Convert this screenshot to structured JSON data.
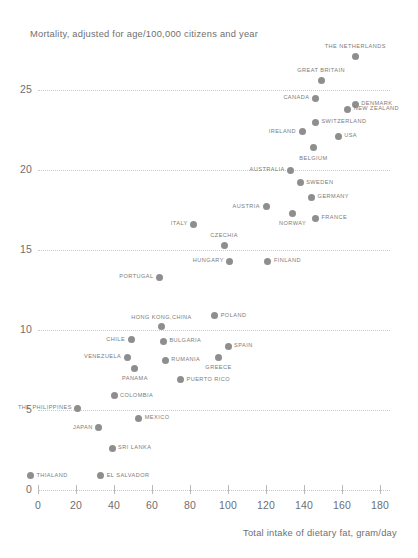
{
  "chart_data": {
    "type": "scatter",
    "title": "",
    "ylabel": "Mortality, adjusted for age/100,000 citizens and year",
    "xlabel": "Total intake of dietary fat, gram/day",
    "xlim": [
      0,
      185
    ],
    "ylim": [
      0,
      27.5
    ],
    "grid": true,
    "legend": false,
    "x_ticks": [
      0,
      20,
      40,
      60,
      80,
      100,
      120,
      140,
      160,
      180
    ],
    "y_ticks": [
      0,
      5,
      10,
      15,
      20,
      25
    ],
    "marker_color": "#8e8e8e",
    "points": [
      {
        "label": "THE NETHERLANDS",
        "x": 167,
        "y": 27.1,
        "pos": "above"
      },
      {
        "label": "GREAT BRITAIN",
        "x": 149,
        "y": 25.6,
        "pos": "above"
      },
      {
        "label": "DENMARK",
        "x": 167,
        "y": 24.1,
        "pos": "right"
      },
      {
        "label": "CANADA",
        "x": 146,
        "y": 24.5,
        "pos": "left"
      },
      {
        "label": "NEW ZEALAND",
        "x": 163,
        "y": 23.8,
        "pos": "right"
      },
      {
        "label": "SWITZERLAND",
        "x": 146,
        "y": 23.0,
        "pos": "right"
      },
      {
        "label": "IRELAND",
        "x": 139,
        "y": 22.4,
        "pos": "left"
      },
      {
        "label": "USA",
        "x": 158,
        "y": 22.1,
        "pos": "right"
      },
      {
        "label": "BELGIUM",
        "x": 145,
        "y": 21.4,
        "pos": "below"
      },
      {
        "label": "AUSTRALIA",
        "x": 133,
        "y": 20.0,
        "pos": "left"
      },
      {
        "label": "SWEDEN",
        "x": 138,
        "y": 19.2,
        "pos": "right"
      },
      {
        "label": "GERMANY",
        "x": 144,
        "y": 18.3,
        "pos": "right"
      },
      {
        "label": "AUSTRIA",
        "x": 120,
        "y": 17.7,
        "pos": "left"
      },
      {
        "label": "NORWAY",
        "x": 134,
        "y": 17.3,
        "pos": "below"
      },
      {
        "label": "FRANCE",
        "x": 146,
        "y": 17.0,
        "pos": "right"
      },
      {
        "label": "ITALY",
        "x": 82,
        "y": 16.6,
        "pos": "left"
      },
      {
        "label": "CZECHIA",
        "x": 98,
        "y": 15.3,
        "pos": "above"
      },
      {
        "label": "HUNGARY",
        "x": 101,
        "y": 14.3,
        "pos": "left"
      },
      {
        "label": "FINLAND",
        "x": 121,
        "y": 14.3,
        "pos": "right"
      },
      {
        "label": "PORTUGAL",
        "x": 64,
        "y": 13.3,
        "pos": "left"
      },
      {
        "label": "POLAND",
        "x": 93,
        "y": 10.9,
        "pos": "right"
      },
      {
        "label": "HONG KONG,CHINA",
        "x": 65,
        "y": 10.2,
        "pos": "above"
      },
      {
        "label": "CHILE",
        "x": 49,
        "y": 9.4,
        "pos": "left"
      },
      {
        "label": "BULGARIA",
        "x": 66,
        "y": 9.3,
        "pos": "right"
      },
      {
        "label": "SPAIN",
        "x": 100,
        "y": 9.0,
        "pos": "right"
      },
      {
        "label": "VENEZUELA",
        "x": 47,
        "y": 8.3,
        "pos": "left"
      },
      {
        "label": "GREECE",
        "x": 95,
        "y": 8.3,
        "pos": "below"
      },
      {
        "label": "RUMANIA",
        "x": 67,
        "y": 8.1,
        "pos": "right"
      },
      {
        "label": "PANAMA",
        "x": 51,
        "y": 7.6,
        "pos": "below"
      },
      {
        "label": "PUERTO RICO",
        "x": 75,
        "y": 6.9,
        "pos": "right"
      },
      {
        "label": "COLOMBIA",
        "x": 40,
        "y": 5.9,
        "pos": "right"
      },
      {
        "label": "THE PHILIPPINES",
        "x": 21,
        "y": 5.1,
        "pos": "left"
      },
      {
        "label": "MEXICO",
        "x": 53,
        "y": 4.5,
        "pos": "right"
      },
      {
        "label": "JAPAN",
        "x": 32,
        "y": 3.9,
        "pos": "left"
      },
      {
        "label": "SRI LANKA",
        "x": 39,
        "y": 2.6,
        "pos": "right"
      },
      {
        "label": "THIALAND",
        "x": -4,
        "y": 0.9,
        "pos": "right"
      },
      {
        "label": "EL SALVADOR",
        "x": 33,
        "y": 0.9,
        "pos": "right"
      }
    ]
  }
}
